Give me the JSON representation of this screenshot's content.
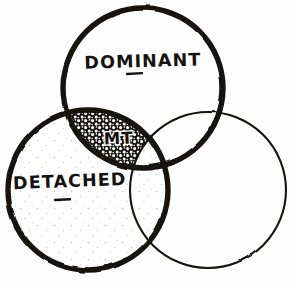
{
  "diagram": {
    "type": "venn-3-circle",
    "style": "hand-drawn",
    "background_color": "#fefefe",
    "ink_color": "#15120f",
    "width": 295,
    "height": 283,
    "sets": [
      {
        "id": "dominant",
        "label": "DOMINANT",
        "position": "top",
        "cx": 143,
        "cy": 88,
        "r": 80,
        "stroke_weight": "thick",
        "stroke_px": 5.4,
        "fill": "none",
        "has_underline_tick": true,
        "label_x": 143,
        "label_y": 67
      },
      {
        "id": "detached",
        "label": "DETACHED",
        "position": "bottom-left",
        "cx": 88,
        "cy": 190,
        "r": 80,
        "stroke_weight": "thick",
        "stroke_px": 5.4,
        "fill": "sparse-stipple",
        "has_underline_tick": true,
        "label_x": 70,
        "label_y": 187
      },
      {
        "id": "unlabeled",
        "label": "",
        "position": "bottom-right",
        "cx": 208,
        "cy": 190,
        "r": 78,
        "stroke_weight": "thin",
        "stroke_px": 2.0,
        "fill": "none",
        "has_underline_tick": false,
        "label_x": 0,
        "label_y": 0
      }
    ],
    "regions": [
      {
        "id": "mt",
        "label": "MT",
        "description": "intersection of dominant and detached, excluding the unlabeled circle",
        "fill": "dense-stipple",
        "label_x": 119,
        "label_y": 139
      }
    ]
  }
}
